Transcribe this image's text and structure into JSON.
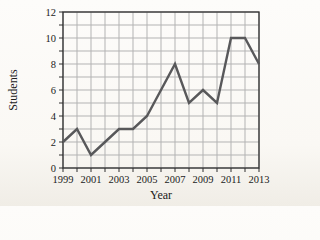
{
  "chart_data": {
    "type": "line",
    "title": "",
    "xlabel": "Year",
    "ylabel": "Students",
    "x": [
      1999,
      2000,
      2001,
      2002,
      2003,
      2004,
      2005,
      2006,
      2007,
      2008,
      2009,
      2010,
      2011,
      2012,
      2013
    ],
    "series": [
      {
        "name": "Students",
        "values": [
          2,
          3,
          1,
          2,
          3,
          3,
          4,
          6,
          8,
          5,
          6,
          5,
          10,
          10,
          8
        ]
      }
    ],
    "xlim": [
      1999,
      2013
    ],
    "ylim": [
      0,
      12
    ],
    "xticks": [
      1999,
      2001,
      2003,
      2005,
      2007,
      2009,
      2011,
      2013
    ],
    "yticks": [
      0,
      2,
      4,
      6,
      8,
      10,
      12
    ],
    "x_minor_step": 1,
    "y_minor_step": 1,
    "grid": true,
    "legend": false,
    "colors": {
      "line": "#58585a",
      "grid": "#b3b3b3",
      "axis": "#2e2e2e",
      "text": "#1b1b1b",
      "background": "#faf8f4"
    }
  }
}
